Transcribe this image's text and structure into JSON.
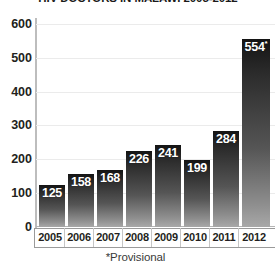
{
  "chart_data": {
    "type": "bar",
    "title": "HIV DOCTORS IN MALAWI 2005-2012",
    "xlabel": "",
    "ylabel": "",
    "categories": [
      "2005",
      "2006",
      "2007",
      "2008",
      "2009",
      "2010",
      "2011",
      "2012"
    ],
    "values": [
      125,
      158,
      168,
      226,
      241,
      199,
      284,
      554
    ],
    "value_labels": [
      "125",
      "158",
      "168",
      "226",
      "241",
      "199",
      "284",
      "554*"
    ],
    "ylim": [
      0,
      600
    ],
    "yticks": [
      600,
      500,
      400,
      300,
      200,
      100,
      0
    ],
    "ytick_labels": [
      "600",
      "500",
      "400",
      "300",
      "200",
      "100",
      "0"
    ],
    "grid": true,
    "legend": false,
    "annotations": [
      "*Provisional"
    ],
    "series": [
      {
        "name": "HIV doctors",
        "values": [
          125,
          158,
          168,
          226,
          241,
          199,
          284,
          554
        ]
      }
    ],
    "colors": {
      "bar_top": "#141414",
      "bar_bottom": "#a8a8a8",
      "gridline": "#ebebeb",
      "axis": "#9a9a9a",
      "text": "#231f20",
      "value_label": "#ffffff",
      "background": "#ffffff"
    }
  },
  "footnote": {
    "text": "*Provisional"
  }
}
